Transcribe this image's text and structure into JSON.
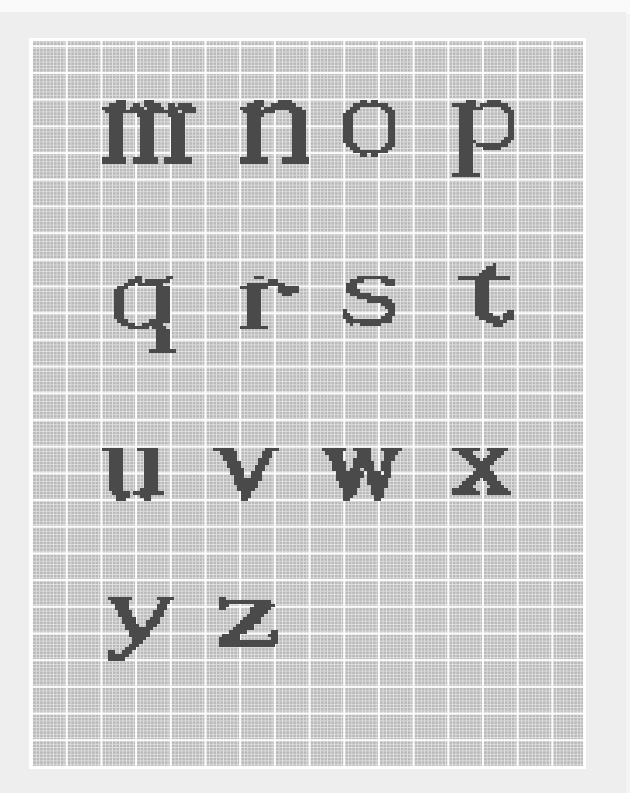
{
  "page": {
    "background_color": "#eeeeee",
    "grid_color": "#b9b9b9",
    "major_line_color": "#ffffff",
    "minor_line_color": "#e4e4e4",
    "ink_color": "#4a4a4a"
  },
  "grid": {
    "cell_width": 3.47,
    "cell_height": 3.34,
    "major_every_cols": 10,
    "major_every_rows": 8
  },
  "letters": [
    {
      "char": "m",
      "x": 102,
      "y": 100,
      "rows": [
        "....###.....###.............",
        "..#####..##.#####..##.####..",
        "#######.####.#####.########.",
        ".#####################.####.",
        "..####....#####....#####....",
        "..####.....####.....####....",
        "..####.....####.....####....",
        "..####.....####.....####....",
        "..####.....####.....####....",
        "..####.....####.....####....",
        "..####.....####.....####....",
        "..####.....####.....####....",
        "..####.....####.....####....",
        "..####.....####.....####....",
        "..####.....####.....####....",
        "..####.....####.....####....",
        "..####.....####.....####....",
        "#######..#######..########..",
        "#######..#######..########.."
      ]
    },
    {
      "char": "n",
      "x": 240,
      "y": 100,
      "rows": [
        "....###....####.....",
        "..#####..#######....",
        "######.###########..",
        ".#########....#####.",
        "..#####........####.",
        "..####.........####.",
        "..####.........####.",
        "..####.........####.",
        "..####.........####.",
        "..####.........####.",
        "..####.........####.",
        "..####.........####.",
        "..####.........####.",
        "..####.........####.",
        "..####.........####.",
        "..####.........####.",
        "..####.........####.",
        "########....########",
        "########....########"
      ]
    },
    {
      "char": "o",
      "x": 343,
      "y": 100,
      "rows": [
        ".....##.##.....",
        "...##########..",
        "..###......###.",
        ".###........###",
        "###..........##",
        "###..........##",
        "###..........##",
        "###..........##",
        "###..........##",
        "###..........##",
        "###..........##",
        "###..........##",
        "###..........##",
        ".###........###",
        "..###......###.",
        "...##########..",
        ".....##.##....."
      ]
    },
    {
      "char": "p",
      "x": 452,
      "y": 100,
      "rows": [
        "....###...####....",
        "#######.########..",
        "..#######.....###.",
        "..####.........###",
        "..####..........##",
        "..####..........##",
        "..####..........##",
        "..####..........##",
        "..####..........##",
        "..####..........##",
        "..####..........##",
        "..####.........###",
        "..#####.......###.",
        "..####.#########..",
        "..####...#####....",
        "..####............",
        "..####............",
        "..####............",
        "..####............",
        "..####............",
        "..####............",
        "..####............",
        "########.........."
      ]
    },
    {
      "char": "q",
      "x": 114,
      "y": 276,
      "rows": [
        "......##.......##.",
        "....####.#######..",
        "...###.#######....",
        ".###........####..",
        "###.........####..",
        "###.........####..",
        "###.........####..",
        "###.........####..",
        "###.........####..",
        "###.........####..",
        "###.........####..",
        "###.........####..",
        "###.........####..",
        ".###......######..",
        "..####..######....",
        "....######.####...",
        "............####..",
        "............####..",
        "............####..",
        "............####..",
        "............####..",
        "............####..",
        "..........########"
      ]
    },
    {
      "char": "r",
      "x": 240,
      "y": 276,
      "rows": [
        "....###...........",
        "........###.......",
        "..###########.....",
        "########...######.",
        "..####.....######.",
        "..####......###...",
        "..####............",
        "..####............",
        "..####............",
        "..####............",
        "..####............",
        "..####............",
        "..####............",
        "..####............",
        "..####............",
        "########.........."
      ]
    },
    {
      "char": "s",
      "x": 343,
      "y": 276,
      "rows": [
        "....#########....",
        "..####.....####..",
        ".###........###..",
        ".###.............",
        ".####............",
        "..######.........",
        "....#########....",
        ".......#######...",
        "...........####..",
        "............###..",
        "#............##..",
        "##..........###..",
        "###........###...",
        ".#############...",
        "..#..######......"
      ]
    },
    {
      "char": "t",
      "x": 458,
      "y": 263,
      "rows": [
        "..........#......",
        "........###......",
        ".......####......",
        "......#####......",
        "###############..",
        ".....####........",
        ".....####........",
        ".....####........",
        ".....####........",
        ".....####........",
        ".....####........",
        ".....####........",
        ".....####........",
        ".....####........",
        ".....####.....##.",
        ".....#####...###.",
        "......######.###.",
        "........######...",
        "..........###...."
      ]
    },
    {
      "char": "u",
      "x": 102,
      "y": 448,
      "rows": [
        "######....######.",
        "..####......####.",
        "..####......####.",
        "..####......####.",
        "..####......####.",
        "..####......####.",
        "..####......####.",
        "..####......####.",
        "..####......####.",
        "..####......####.",
        "..####......####.",
        "..####......####.",
        "..####.....#####.",
        "...#####.#########",
        "....####...###...",
        "....###.....##..."
      ]
    },
    {
      "char": "v",
      "x": 213,
      "y": 448,
      "rows": [
        "######.........####",
        "..#####.......###..",
        "...####.......###..",
        "...####......###...",
        "....####.....###...",
        "....####....###....",
        ".....####...###....",
        ".....####..###.....",
        "......###..###.....",
        "......########.....",
        "......#######......",
        ".......######......",
        ".......#####.......",
        "........###........",
        "........###........",
        "........##........."
      ]
    },
    {
      "char": "w",
      "x": 322,
      "y": 448,
      "rows": [
        "#######..#####...######",
        ".#####....####....####.",
        "..####....####....###..",
        "..####...#####....###..",
        "...####..######..###...",
        "...####..######..###...",
        "...####.###.###..###...",
        "....########.####.##...",
        "....########.#######...",
        "....#######..######....",
        ".....######..######....",
        ".....######...#####....",
        "......####....####.....",
        "......####....####.....",
        "......###......###.....",
        "......##.......##......"
      ]
    },
    {
      "char": "x",
      "x": 452,
      "y": 448,
      "rows": [
        "########..######",
        "..####.....####.",
        "...####...####..",
        "....####.####...",
        ".....#######....",
        "......#####.....",
        ".......####.....",
        "......######....",
        ".....########...",
        "....####.####...",
        "...####...####..",
        "..####.....####.",
        "#######...######",
        "########..#######"
      ]
    },
    {
      "char": "y",
      "x": 108,
      "y": 597,
      "rows": [
        "#######.......#####",
        ".#####.........###.",
        "..####........###..",
        "..####........###..",
        "...####......###...",
        "...####......###...",
        "....####....###....",
        "....####...####....",
        ".....####..###.....",
        ".....########......",
        "......######.......",
        "......######.......",
        ".......####........",
        ".......###.........",
        "......###..........",
        ".....###...........",
        "##..###............",
        "######.............",
        "#####.............."
      ]
    },
    {
      "char": "z",
      "x": 219,
      "y": 597,
      "rows": [
        "##................",
        "###############...",
        "###.......######..",
        "##.......######...",
        ".........#####....",
        "........#####.....",
        ".......#####......",
        "......######......",
        ".....#####........",
        "....######........",
        "...#####.......##.",
        ".#####........###.",
        "######.........##.",
        "#################.",
        "################.."
      ]
    }
  ]
}
